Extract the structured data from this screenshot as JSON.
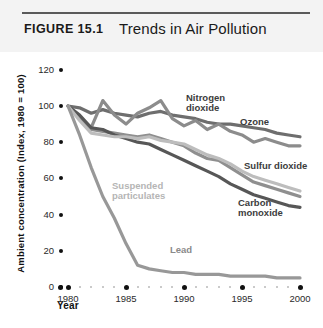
{
  "header": {
    "figure_label": "FIGURE 15.1",
    "title": "Trends in Air Pollution"
  },
  "axes": {
    "ylabel": "Ambient concentration (Index, 1980 = 100)",
    "xlabel": "Year",
    "yticks": [
      "0",
      "20",
      "40",
      "60",
      "80",
      "100",
      "120"
    ],
    "xticks": [
      "1980",
      "1985",
      "1990",
      "1995",
      "2000"
    ]
  },
  "series_labels": {
    "nitrogen_dioxide": "Nitrogen\ndioxide",
    "ozone": "Ozone",
    "sulfur_dioxide": "Sulfur dioxide",
    "carbon_monoxide": "Carbon\nmonoxide",
    "suspended_particulates": "Suspended\nparticulates",
    "lead": "Lead"
  },
  "chart_data": {
    "type": "line",
    "title": "Trends in Air Pollution",
    "xlabel": "Year",
    "ylabel": "Ambient concentration (Index, 1980 = 100)",
    "xlim": [
      1980,
      2000
    ],
    "ylim": [
      0,
      120
    ],
    "grid": false,
    "legend": "inline-labels",
    "x": [
      1980,
      1981,
      1982,
      1983,
      1984,
      1985,
      1986,
      1987,
      1988,
      1989,
      1990,
      1991,
      1992,
      1993,
      1994,
      1995,
      1996,
      1997,
      1998,
      1999,
      2000
    ],
    "series": [
      {
        "name": "Nitrogen dioxide",
        "color": "#6e6e6e",
        "values": [
          100,
          99,
          96,
          98,
          96,
          95,
          94,
          96,
          97,
          95,
          94,
          93,
          91,
          90,
          90,
          89,
          88,
          87,
          85,
          84,
          83
        ]
      },
      {
        "name": "Ozone",
        "color": "#8c8c8c",
        "values": [
          100,
          94,
          88,
          103,
          95,
          90,
          96,
          99,
          103,
          93,
          89,
          92,
          87,
          90,
          86,
          84,
          80,
          82,
          80,
          78,
          78
        ]
      },
      {
        "name": "Sulfur dioxide",
        "color": "#8f8f8f",
        "values": [
          100,
          93,
          87,
          86,
          85,
          84,
          83,
          84,
          82,
          80,
          78,
          74,
          71,
          70,
          66,
          62,
          58,
          56,
          54,
          52,
          50
        ]
      },
      {
        "name": "Carbon monoxide",
        "color": "#575757",
        "values": [
          100,
          95,
          88,
          87,
          84,
          82,
          80,
          79,
          76,
          73,
          70,
          67,
          64,
          61,
          57,
          54,
          51,
          49,
          47,
          45,
          44
        ]
      },
      {
        "name": "Suspended particulates",
        "color": "#bdbdbd",
        "values": [
          100,
          92,
          85,
          84,
          83,
          83,
          82,
          83,
          81,
          80,
          79,
          76,
          73,
          71,
          68,
          64,
          61,
          59,
          57,
          55,
          53
        ]
      },
      {
        "name": "Lead",
        "color": "#989898",
        "values": [
          100,
          84,
          66,
          50,
          38,
          24,
          12,
          10,
          9,
          8,
          8,
          7,
          7,
          7,
          6,
          6,
          6,
          6,
          5,
          5,
          5
        ]
      }
    ]
  }
}
